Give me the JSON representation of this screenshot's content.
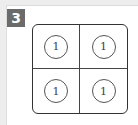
{
  "puzzle": {
    "number_label": "3",
    "grid": {
      "rows": 2,
      "cols": 2,
      "cells": [
        "1",
        "1",
        "1",
        "1"
      ]
    }
  }
}
